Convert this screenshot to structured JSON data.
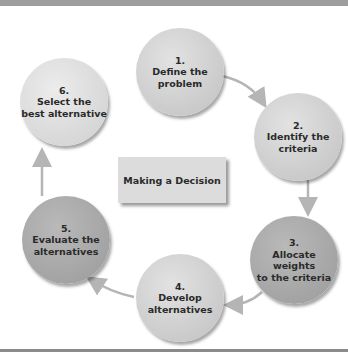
{
  "diagram": {
    "title": "Making a Decision",
    "steps": [
      {
        "number": "1.",
        "label": "Define the\nproblem"
      },
      {
        "number": "2.",
        "label": "Identify the\ncriteria"
      },
      {
        "number": "3.",
        "label": "Allocate weights\nto the criteria"
      },
      {
        "number": "4.",
        "label": "Develop\nalternatives"
      },
      {
        "number": "5.",
        "label": "Evaluate the\nalternatives"
      },
      {
        "number": "6.",
        "label": "Select the\nbest alternative"
      }
    ],
    "flow": [
      "1->2",
      "2->3",
      "3->4",
      "4->5",
      "5->6"
    ],
    "colors": {
      "arrow": "#b5b5b5",
      "box": "#dcdcdc",
      "circle_light": "#cccccc",
      "circle_dark": "#a5a5a5"
    }
  }
}
